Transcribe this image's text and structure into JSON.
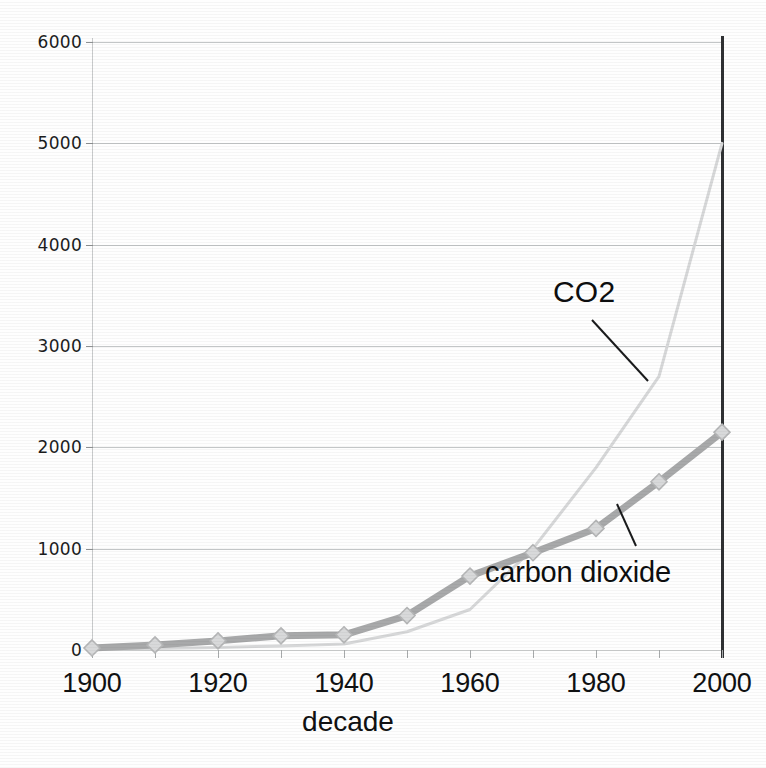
{
  "chart_data": {
    "type": "line",
    "title": "",
    "subtitle": "",
    "xlabel": "decade",
    "ylabel": "",
    "xlim": [
      1900,
      2000
    ],
    "ylim": [
      0,
      6000
    ],
    "grid": true,
    "legend_position": "inline-annotations",
    "x": [
      1900,
      1910,
      1920,
      1930,
      1940,
      1950,
      1960,
      1970,
      1980,
      1990,
      2000
    ],
    "x_tick_labels": [
      "1900",
      "1920",
      "1940",
      "1960",
      "1980",
      "2000"
    ],
    "x_tick_values": [
      1900,
      1920,
      1940,
      1960,
      1980,
      2000
    ],
    "y_tick_labels": [
      "0",
      "1000",
      "2000",
      "3000",
      "4000",
      "5000",
      "6000"
    ],
    "y_tick_values": [
      0,
      1000,
      2000,
      3000,
      4000,
      5000,
      6000
    ],
    "series": [
      {
        "name": "carbon dioxide",
        "color": "#a8a9aa",
        "marker": "diamond",
        "marker_color": "#d8d9da",
        "line_width": 7,
        "values": [
          20,
          50,
          90,
          140,
          150,
          340,
          730,
          960,
          1200,
          1660,
          2150
        ]
      },
      {
        "name": "CO2",
        "color": "#d7d8d9",
        "marker": "none",
        "line_width": 3,
        "values": [
          10,
          15,
          25,
          40,
          60,
          180,
          400,
          1000,
          1800,
          2700,
          5000
        ]
      }
    ],
    "annotations": [
      {
        "label": "CO2",
        "target_series": "CO2",
        "text_x": 553,
        "text_y": 275,
        "leader_from_x": 592,
        "leader_from_y": 320,
        "leader_to_x": 648,
        "leader_to_y": 381
      },
      {
        "label": "carbon dioxide",
        "target_series": "carbon dioxide",
        "text_x": 485,
        "text_y": 556,
        "leader_from_x": 617,
        "leader_from_y": 504,
        "leader_to_x": 636,
        "leader_to_y": 546
      }
    ]
  },
  "axis": {
    "x_title": "decade"
  },
  "colors": {
    "grid": "#b9bcbd",
    "axis": "#c9cbcc",
    "right_axis": "#2f3133",
    "text": "#101112",
    "series_carbon_dioxide": "#a8a9aa",
    "series_co2": "#d7d8d9",
    "background": "#ffffff"
  }
}
